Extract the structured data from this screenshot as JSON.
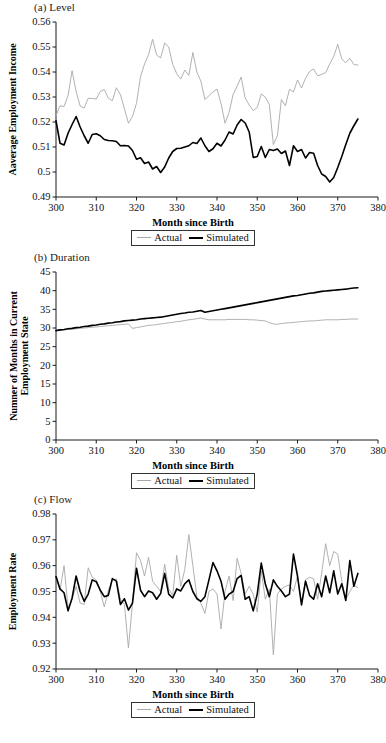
{
  "figure": {
    "series_names": [
      "Actual",
      "Simulated"
    ],
    "colors": {
      "actual": "#a8a8a8",
      "simulated": "#000000",
      "axis": "#1a1a1a"
    },
    "legend": {
      "actual_label": "Actual",
      "simulated_label": "Simulated"
    },
    "shared_xlabel": "Month since Birth"
  },
  "panels": [
    {
      "title": "(a) Level",
      "ylabel": "Aaverage Employment Income",
      "xlabel": "Month since Birth"
    },
    {
      "title": "(b) Duration",
      "ylabel": "Numner of Months in Current Employment State",
      "xlabel": "Month since Birth"
    },
    {
      "title": "(c) Flow",
      "ylabel": "Employment Rate",
      "xlabel": "Month since Birth"
    }
  ],
  "chart_data": [
    {
      "type": "line",
      "title": "(a) Level",
      "xlabel": "Month since Birth",
      "ylabel": "Aaverage Employment Income",
      "xlim": [
        300,
        380
      ],
      "ylim": [
        0.49,
        0.56
      ],
      "xticks": [
        300,
        310,
        320,
        330,
        340,
        350,
        360,
        370,
        380
      ],
      "yticks": [
        0.49,
        0.5,
        0.51,
        0.52,
        0.53,
        0.54,
        0.55,
        0.56
      ],
      "grid": false,
      "legend_position": "below-center",
      "x": [
        300,
        301,
        302,
        303,
        304,
        305,
        306,
        307,
        308,
        309,
        310,
        311,
        312,
        313,
        314,
        315,
        316,
        317,
        318,
        319,
        320,
        321,
        322,
        323,
        324,
        325,
        326,
        327,
        328,
        329,
        330,
        331,
        332,
        333,
        334,
        335,
        336,
        337,
        338,
        339,
        340,
        341,
        342,
        343,
        344,
        345,
        346,
        347,
        348,
        349,
        350,
        351,
        352,
        353,
        354,
        355,
        356,
        357,
        358,
        359,
        360,
        361,
        362,
        363,
        364,
        365,
        366,
        367,
        368,
        369,
        370,
        371,
        372,
        373,
        374,
        375
      ],
      "series": [
        {
          "name": "Actual",
          "color": "#a8a8a8",
          "values": [
            0.5225,
            0.5265,
            0.5262,
            0.5307,
            0.5405,
            0.5322,
            0.5264,
            0.5256,
            0.5295,
            0.5294,
            0.5292,
            0.5322,
            0.533,
            0.5295,
            0.5285,
            0.5337,
            0.531,
            0.5253,
            0.5195,
            0.5222,
            0.5275,
            0.5382,
            0.5432,
            0.547,
            0.5531,
            0.5468,
            0.5456,
            0.5516,
            0.55,
            0.543,
            0.5393,
            0.5372,
            0.5408,
            0.5386,
            0.5478,
            0.54,
            0.5363,
            0.529,
            0.5305,
            0.532,
            0.5332,
            0.5274,
            0.5195,
            0.5238,
            0.531,
            0.5343,
            0.538,
            0.5296,
            0.5268,
            0.5246,
            0.5258,
            0.5312,
            0.53,
            0.527,
            0.511,
            0.5145,
            0.529,
            0.5265,
            0.5331,
            0.532,
            0.5368,
            0.5336,
            0.5375,
            0.5402,
            0.5412,
            0.5385,
            0.539,
            0.5398,
            0.5432,
            0.5462,
            0.5511,
            0.5452,
            0.5437,
            0.5455,
            0.543,
            0.5428
          ]
        },
        {
          "name": "Simulated",
          "color": "#000000",
          "values": [
            0.5205,
            0.5115,
            0.5108,
            0.5155,
            0.519,
            0.5222,
            0.518,
            0.5145,
            0.5115,
            0.515,
            0.5153,
            0.5145,
            0.513,
            0.5126,
            0.5125,
            0.5122,
            0.5105,
            0.5106,
            0.5104,
            0.5086,
            0.5051,
            0.5057,
            0.5034,
            0.504,
            0.5012,
            0.5022,
            0.4998,
            0.502,
            0.5056,
            0.5082,
            0.5094,
            0.5095,
            0.51,
            0.5105,
            0.5118,
            0.5114,
            0.5136,
            0.5105,
            0.5082,
            0.5093,
            0.5115,
            0.5104,
            0.5128,
            0.516,
            0.5152,
            0.5188,
            0.521,
            0.5196,
            0.516,
            0.5058,
            0.5062,
            0.5102,
            0.5058,
            0.509,
            0.5086,
            0.5092,
            0.5074,
            0.5084,
            0.5026,
            0.5105,
            0.5082,
            0.509,
            0.5056,
            0.5078,
            0.5075,
            0.5026,
            0.4992,
            0.4982,
            0.496,
            0.4978,
            0.5018,
            0.5062,
            0.511,
            0.5155,
            0.5185,
            0.5212
          ]
        }
      ]
    },
    {
      "type": "line",
      "title": "(b) Duration",
      "xlabel": "Month since Birth",
      "ylabel": "Numner of Months in Current Employment State",
      "xlim": [
        300,
        380
      ],
      "ylim": [
        0,
        45
      ],
      "xticks": [
        300,
        310,
        320,
        330,
        340,
        350,
        360,
        370,
        380
      ],
      "yticks": [
        0,
        5,
        10,
        15,
        20,
        25,
        30,
        35,
        40,
        45
      ],
      "grid": false,
      "legend_position": "below-center",
      "x": [
        300,
        301,
        302,
        303,
        304,
        305,
        306,
        307,
        308,
        309,
        310,
        311,
        312,
        313,
        314,
        315,
        316,
        317,
        318,
        319,
        320,
        321,
        322,
        323,
        324,
        325,
        326,
        327,
        328,
        329,
        330,
        331,
        332,
        333,
        334,
        335,
        336,
        337,
        338,
        339,
        340,
        341,
        342,
        343,
        344,
        345,
        346,
        347,
        348,
        349,
        350,
        351,
        352,
        353,
        354,
        355,
        356,
        357,
        358,
        359,
        360,
        361,
        362,
        363,
        364,
        365,
        366,
        367,
        368,
        369,
        370,
        371,
        372,
        373,
        374,
        375
      ],
      "series": [
        {
          "name": "Actual",
          "color": "#a8a8a8",
          "values": [
            29.3,
            29.4,
            29.5,
            29.6,
            29.7,
            29.8,
            29.9,
            30.0,
            30.1,
            30.2,
            30.3,
            30.4,
            30.5,
            30.6,
            30.7,
            30.8,
            30.9,
            31.0,
            31.1,
            29.9,
            30.1,
            30.3,
            30.5,
            30.7,
            30.8,
            30.9,
            31.1,
            31.2,
            31.4,
            31.5,
            31.7,
            31.8,
            32.0,
            32.2,
            32.3,
            32.5,
            32.7,
            32.4,
            32.2,
            32.2,
            32.2,
            32.2,
            32.2,
            32.3,
            32.3,
            32.3,
            32.3,
            32.3,
            32.2,
            32.2,
            32.1,
            32.0,
            31.9,
            31.4,
            31.1,
            31.0,
            31.2,
            31.3,
            31.4,
            31.5,
            31.6,
            31.7,
            31.8,
            31.9,
            31.9,
            32.0,
            32.1,
            32.2,
            32.2,
            32.2,
            32.2,
            32.3,
            32.3,
            32.4,
            32.4,
            32.4
          ]
        },
        {
          "name": "Simulated",
          "color": "#000000",
          "values": [
            29.3,
            29.5,
            29.6,
            29.8,
            29.9,
            30.1,
            30.2,
            30.4,
            30.5,
            30.7,
            30.8,
            31.0,
            31.1,
            31.3,
            31.4,
            31.6,
            31.7,
            31.9,
            32.0,
            32.1,
            32.2,
            32.4,
            32.5,
            32.6,
            32.7,
            32.8,
            32.9,
            33.1,
            33.3,
            33.5,
            33.7,
            33.9,
            34.0,
            34.2,
            34.3,
            34.5,
            34.7,
            34.2,
            34.4,
            34.6,
            34.8,
            35.0,
            35.2,
            35.4,
            35.6,
            35.8,
            36.0,
            36.2,
            36.4,
            36.6,
            36.8,
            37.0,
            37.2,
            37.4,
            37.6,
            37.8,
            38.0,
            38.2,
            38.4,
            38.6,
            38.7,
            38.9,
            39.1,
            39.3,
            39.4,
            39.6,
            39.8,
            39.9,
            40.0,
            40.1,
            40.2,
            40.3,
            40.4,
            40.6,
            40.7,
            40.8
          ]
        }
      ]
    },
    {
      "type": "line",
      "title": "(c) Flow",
      "xlabel": "Month since Birth",
      "ylabel": "Employment Rate",
      "xlim": [
        300,
        380
      ],
      "ylim": [
        0.92,
        0.98
      ],
      "xticks": [
        300,
        310,
        320,
        330,
        340,
        350,
        360,
        370,
        380
      ],
      "yticks": [
        0.92,
        0.93,
        0.94,
        0.95,
        0.96,
        0.97,
        0.98
      ],
      "grid": false,
      "legend_position": "below-center",
      "x": [
        300,
        301,
        302,
        303,
        304,
        305,
        306,
        307,
        308,
        309,
        310,
        311,
        312,
        313,
        314,
        315,
        316,
        317,
        318,
        319,
        320,
        321,
        322,
        323,
        324,
        325,
        326,
        327,
        328,
        329,
        330,
        331,
        332,
        333,
        334,
        335,
        336,
        337,
        338,
        339,
        340,
        341,
        342,
        343,
        344,
        345,
        346,
        347,
        348,
        349,
        350,
        351,
        352,
        353,
        354,
        355,
        356,
        357,
        358,
        359,
        360,
        361,
        362,
        363,
        364,
        365,
        366,
        367,
        368,
        369,
        370,
        371,
        372,
        373,
        374,
        375
      ],
      "series": [
        {
          "name": "Actual",
          "color": "#a8a8a8",
          "values": [
            0.9565,
            0.9505,
            0.96,
            0.9435,
            0.947,
            0.952,
            0.9455,
            0.945,
            0.9592,
            0.9555,
            0.9545,
            0.95,
            0.944,
            0.9505,
            0.9545,
            0.9548,
            0.947,
            0.945,
            0.9282,
            0.9455,
            0.965,
            0.962,
            0.956,
            0.9632,
            0.954,
            0.952,
            0.95,
            0.9605,
            0.951,
            0.9485,
            0.964,
            0.952,
            0.9585,
            0.972,
            0.96,
            0.948,
            0.9455,
            0.9415,
            0.95,
            0.951,
            0.949,
            0.9355,
            0.95,
            0.956,
            0.9465,
            0.9628,
            0.957,
            0.949,
            0.952,
            0.949,
            0.942,
            0.958,
            0.947,
            0.951,
            0.9255,
            0.949,
            0.951,
            0.952,
            0.9525,
            0.95,
            0.956,
            0.9455,
            0.9545,
            0.9555,
            0.955,
            0.947,
            0.957,
            0.9685,
            0.96,
            0.9655,
            0.9645,
            0.954,
            0.947,
            0.95,
            0.9525,
            0.9515
          ]
        },
        {
          "name": "Simulated",
          "color": "#000000",
          "values": [
            0.9558,
            0.951,
            0.9495,
            0.9425,
            0.9475,
            0.956,
            0.95,
            0.9462,
            0.949,
            0.9545,
            0.9538,
            0.9505,
            0.948,
            0.9485,
            0.955,
            0.954,
            0.945,
            0.9472,
            0.9428,
            0.9455,
            0.959,
            0.9505,
            0.948,
            0.9502,
            0.9495,
            0.947,
            0.9492,
            0.957,
            0.949,
            0.9475,
            0.951,
            0.9502,
            0.953,
            0.9545,
            0.95,
            0.9472,
            0.9462,
            0.948,
            0.9545,
            0.9612,
            0.958,
            0.954,
            0.947,
            0.949,
            0.95,
            0.955,
            0.9562,
            0.947,
            0.948,
            0.9425,
            0.949,
            0.961,
            0.953,
            0.948,
            0.9545,
            0.952,
            0.9502,
            0.948,
            0.949,
            0.9645,
            0.956,
            0.9448,
            0.954,
            0.9485,
            0.947,
            0.953,
            0.948,
            0.956,
            0.9495,
            0.958,
            0.949,
            0.953,
            0.9465,
            0.962,
            0.952,
            0.957
          ]
        }
      ]
    }
  ]
}
